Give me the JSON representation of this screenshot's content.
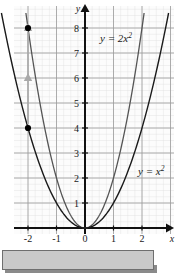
{
  "figure": {
    "title": "",
    "axis_labels": {
      "x": "x",
      "y": "y"
    },
    "curve_labels": {
      "upper": {
        "base": "y = 2x",
        "exponent": "2"
      },
      "lower": {
        "base": "y = x",
        "exponent": "2"
      }
    },
    "colors": {
      "axis": "#111111",
      "major_grid": "#999999",
      "minor_grid": "#d8d8d8",
      "curve_upper": "#555555",
      "curve_lower": "#1a1a1a",
      "marker": "#000000",
      "arrow": "#a9a9a9",
      "panel_bg": "#fcfcfc",
      "bottom_bar": "#c9c9c9",
      "bottom_bar_border": "#6e6e6e"
    }
  },
  "chart_data": {
    "type": "line",
    "title": "",
    "xlabel": "x",
    "ylabel": "y",
    "xlim": [
      -2.6,
      2.6
    ],
    "ylim": [
      -0.6,
      8.6
    ],
    "grid": true,
    "minor_grid": true,
    "legend": "inline-curve-labels",
    "xticks": [
      -2,
      -1,
      0,
      1,
      2
    ],
    "xtick_labels": [
      "-2",
      "-1",
      "0",
      "1",
      "2"
    ],
    "yticks": [
      1,
      2,
      3,
      4,
      5,
      6,
      7,
      8
    ],
    "ytick_labels": [
      "1",
      "2",
      "3",
      "4",
      "5",
      "6",
      "7",
      "8"
    ],
    "series": [
      {
        "name": "y = 2x^2",
        "equation": "y = 2x²",
        "coefficient": 2,
        "color": "#555555",
        "x": [
          -2.05,
          -1.8,
          -1.6,
          -1.4,
          -1.2,
          -1.0,
          -0.8,
          -0.6,
          -0.4,
          -0.2,
          0,
          0.2,
          0.4,
          0.6,
          0.8,
          1.0,
          1.2,
          1.4,
          1.6,
          1.8,
          2.05
        ],
        "values": [
          8.4,
          6.48,
          5.12,
          3.92,
          2.88,
          2.0,
          1.28,
          0.72,
          0.32,
          0.08,
          0,
          0.08,
          0.32,
          0.72,
          1.28,
          2.0,
          2.88,
          3.92,
          5.12,
          6.48,
          8.4
        ]
      },
      {
        "name": "y = x^2",
        "equation": "y = x²",
        "coefficient": 1,
        "color": "#1a1a1a",
        "x": [
          -2.05,
          -1.8,
          -1.6,
          -1.4,
          -1.2,
          -1.0,
          -0.8,
          -0.6,
          -0.4,
          -0.2,
          0,
          0.2,
          0.4,
          0.6,
          0.8,
          1.0,
          1.2,
          1.4,
          1.6,
          1.8,
          2.05
        ],
        "values": [
          4.2,
          3.24,
          2.56,
          1.96,
          1.44,
          1.0,
          0.64,
          0.36,
          0.16,
          0.04,
          0,
          0.04,
          0.16,
          0.36,
          0.64,
          1.0,
          1.44,
          1.96,
          2.56,
          3.24,
          4.2
        ]
      }
    ],
    "markers": [
      {
        "name": "point-on-x-squared",
        "x": -2,
        "y": 4,
        "label": ""
      },
      {
        "name": "point-on-2x-squared",
        "x": -2,
        "y": 8,
        "label": ""
      }
    ],
    "annotations": [
      {
        "name": "vertical-stretch-arrow",
        "type": "double-arrow-up",
        "x": -2,
        "y_start": 4,
        "y_end": 8,
        "color": "#a9a9a9",
        "description": "gray arrows at x = -2 showing vertical stretch from y = 4 to y = 8"
      }
    ]
  }
}
